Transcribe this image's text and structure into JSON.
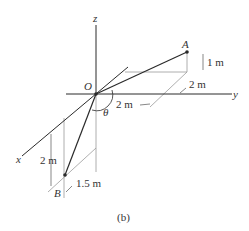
{
  "figure": {
    "caption": "(b)",
    "axes": {
      "x": "x",
      "y": "y",
      "z": "z"
    },
    "points": {
      "origin": "O",
      "A": "A",
      "B": "B"
    },
    "angle": "θ",
    "dimensions": {
      "a_height": "1 m",
      "a_x_offset": "2 m",
      "a_y_offset": "2 m",
      "b_depth": "2 m",
      "b_y_offset": "1.5 m"
    },
    "colors": {
      "main_line": "#2a2a2a",
      "construction_line": "#9a9a9a",
      "text": "#333333"
    }
  }
}
